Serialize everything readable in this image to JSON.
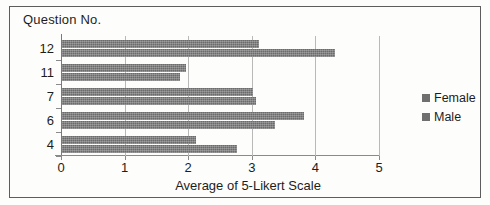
{
  "chart_data": {
    "type": "bar",
    "orientation": "horizontal",
    "title": "",
    "xlabel": "Average of 5-Likert Scale",
    "ylabel": "Question No.",
    "categories": [
      "12",
      "11",
      "7",
      "6",
      "4"
    ],
    "series": [
      {
        "name": "Female",
        "values": [
          3.1,
          1.95,
          3.0,
          3.8,
          2.1
        ]
      },
      {
        "name": "Male",
        "values": [
          4.3,
          1.85,
          3.05,
          3.35,
          2.75
        ]
      }
    ],
    "xlim": [
      0,
      5
    ],
    "xticks": [
      "0",
      "1",
      "2",
      "3",
      "4",
      "5"
    ],
    "grid": true,
    "legend_position": "right",
    "legend": [
      "Female",
      "Male"
    ],
    "bar_color": "#6f6f6f"
  }
}
